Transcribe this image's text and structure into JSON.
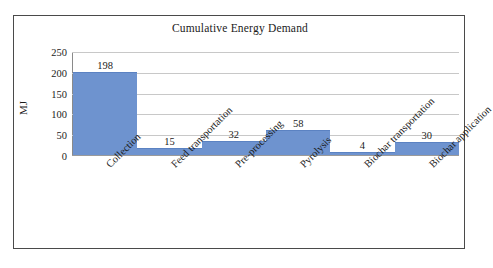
{
  "chart_data": {
    "type": "bar",
    "title": "Cumulative Energy Demand",
    "xlabel": "",
    "ylabel": "MJ",
    "categories": [
      "Collection",
      "Feed transportation",
      "Pre-processing",
      "Pyrolysis",
      "Biochar transportation",
      "Biochar application"
    ],
    "values": [
      198,
      15,
      32,
      58,
      4,
      30
    ],
    "value_labels": [
      "198",
      "15",
      "32",
      "58",
      "4",
      "30"
    ],
    "ylim": [
      0,
      250
    ],
    "yticks": [
      0,
      50,
      100,
      150,
      200,
      250
    ],
    "ytick_labels": [
      "0",
      "50",
      "100",
      "150",
      "200",
      "250"
    ],
    "grid": true,
    "legend": false,
    "bar_color": "#6e93cf",
    "gridline_color": "#c8c8c8",
    "frame_color": "#4a4a4a",
    "text_color": "#1b1b1b"
  }
}
